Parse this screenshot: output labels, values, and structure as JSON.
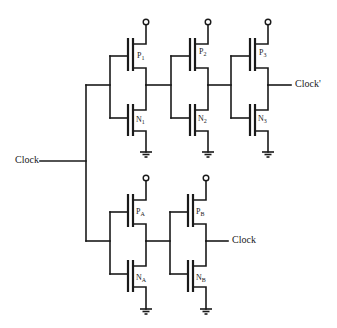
{
  "diagram": {
    "type": "CMOS inverter chain schematic",
    "signals": {
      "input": "Clock",
      "output_top": "Clock'",
      "output_bottom": "Clock"
    },
    "transistors": {
      "p1": {
        "letter": "P",
        "sub": "1"
      },
      "n1": {
        "letter": "N",
        "sub": "1"
      },
      "p2": {
        "letter": "P",
        "sub": "2"
      },
      "n2": {
        "letter": "N",
        "sub": "2"
      },
      "p3": {
        "letter": "P",
        "sub": "3"
      },
      "n3": {
        "letter": "N",
        "sub": "3"
      },
      "pa": {
        "letter": "P",
        "sub": "A"
      },
      "na": {
        "letter": "N",
        "sub": "A"
      },
      "pb": {
        "letter": "P",
        "sub": "B"
      },
      "nb": {
        "letter": "N",
        "sub": "B"
      }
    },
    "colors": {
      "ink": "#1a1a1a",
      "background": "#ffffff"
    }
  }
}
